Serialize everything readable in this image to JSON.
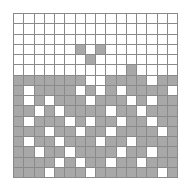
{
  "figure": {
    "type": "binary-grid-bitmap",
    "rows": 16,
    "cols": 16,
    "cell_size_px": 10,
    "grid_origin_px": [
      13,
      13
    ],
    "grid_size_px": [
      165,
      165
    ],
    "colors": {
      "background": "#ffffff",
      "empty_cell": "#ffffff",
      "filled_cell": "#a8a8a8",
      "grid_line": "#8a8a8a"
    },
    "matrix": [
      [
        0,
        0,
        0,
        0,
        0,
        0,
        0,
        0,
        0,
        0,
        0,
        0,
        0,
        0,
        0,
        0
      ],
      [
        0,
        0,
        0,
        0,
        0,
        0,
        0,
        0,
        0,
        0,
        0,
        0,
        0,
        0,
        0,
        0
      ],
      [
        0,
        0,
        0,
        0,
        0,
        0,
        0,
        0,
        0,
        0,
        0,
        0,
        0,
        0,
        0,
        0
      ],
      [
        0,
        0,
        0,
        0,
        0,
        0,
        1,
        0,
        1,
        0,
        0,
        0,
        0,
        0,
        0,
        0
      ],
      [
        0,
        0,
        0,
        0,
        0,
        0,
        0,
        1,
        0,
        0,
        0,
        0,
        0,
        0,
        0,
        0
      ],
      [
        0,
        0,
        0,
        0,
        0,
        0,
        0,
        0,
        0,
        0,
        0,
        1,
        0,
        0,
        0,
        0
      ],
      [
        1,
        1,
        1,
        1,
        1,
        1,
        1,
        0,
        0,
        1,
        1,
        1,
        1,
        0,
        1,
        1
      ],
      [
        1,
        0,
        1,
        1,
        1,
        1,
        0,
        1,
        0,
        1,
        0,
        1,
        1,
        1,
        1,
        0
      ],
      [
        1,
        0,
        1,
        0,
        1,
        1,
        1,
        0,
        1,
        1,
        1,
        0,
        1,
        0,
        1,
        1
      ],
      [
        1,
        1,
        0,
        1,
        0,
        1,
        1,
        1,
        1,
        0,
        1,
        1,
        0,
        1,
        1,
        1
      ],
      [
        1,
        0,
        1,
        1,
        1,
        0,
        1,
        0,
        1,
        1,
        0,
        1,
        1,
        0,
        1,
        1
      ],
      [
        1,
        1,
        1,
        0,
        1,
        1,
        0,
        1,
        1,
        0,
        1,
        1,
        1,
        1,
        0,
        1
      ],
      [
        1,
        0,
        1,
        1,
        0,
        1,
        1,
        1,
        0,
        1,
        1,
        0,
        1,
        1,
        1,
        1
      ],
      [
        1,
        1,
        0,
        1,
        1,
        0,
        1,
        1,
        1,
        1,
        0,
        1,
        1,
        0,
        1,
        1
      ],
      [
        1,
        1,
        1,
        1,
        0,
        1,
        0,
        1,
        1,
        0,
        1,
        1,
        0,
        1,
        1,
        1
      ],
      [
        1,
        1,
        1,
        0,
        1,
        1,
        1,
        0,
        1,
        1,
        1,
        1,
        1,
        1,
        0,
        1
      ]
    ]
  }
}
